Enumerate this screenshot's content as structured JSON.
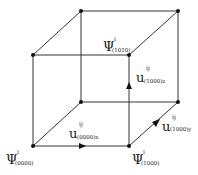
{
  "diagram": {
    "type": "cube-lattice",
    "colors": {
      "line": "#333333",
      "node": "#111111",
      "background": "#ffffff"
    },
    "nodes": [
      {
        "id": "back-top-left",
        "x": 81,
        "y": 11
      },
      {
        "id": "back-top-right",
        "x": 178,
        "y": 11
      },
      {
        "id": "front-top-left",
        "x": 33,
        "y": 55
      },
      {
        "id": "front-top-right",
        "x": 129,
        "y": 55
      },
      {
        "id": "back-bottom-left",
        "x": 81,
        "y": 102
      },
      {
        "id": "back-bottom-right",
        "x": 178,
        "y": 102
      },
      {
        "id": "front-bottom-left",
        "x": 33,
        "y": 146
      },
      {
        "id": "front-bottom-right",
        "x": 129,
        "y": 146
      }
    ],
    "labels": {
      "psi_0000": {
        "main": "Ψ",
        "sup": "i",
        "sub": "(0000)"
      },
      "psi_1000": {
        "main": "Ψ",
        "sup": "i",
        "sub": "(1000)"
      },
      "psi_1010": {
        "main": "Ψ",
        "sup": "i",
        "sub": "(1010)"
      },
      "u_0000x": {
        "main": "u",
        "sup": "ij",
        "sub": "(0000)x"
      },
      "u_1000z": {
        "main": "u",
        "sup": "ij",
        "sub": "(1000)z"
      },
      "u_1000y": {
        "main": "u",
        "sup": "ij",
        "sub": "(1000)y"
      }
    }
  }
}
